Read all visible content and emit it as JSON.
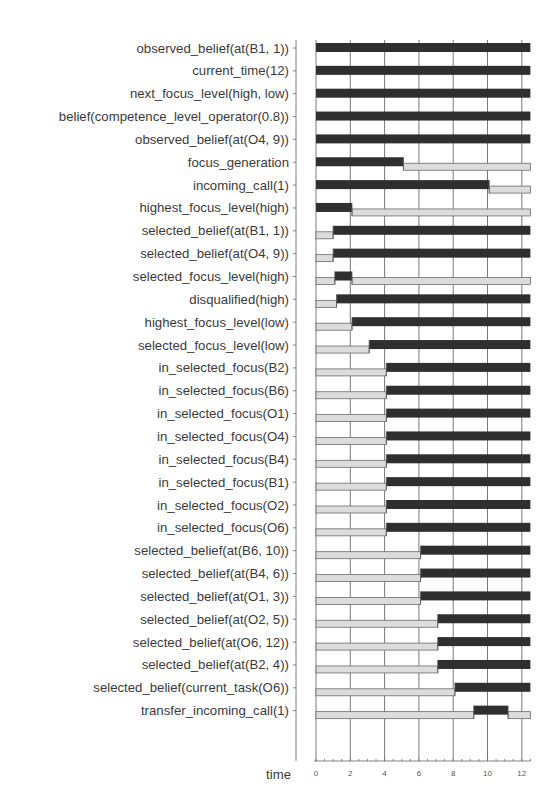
{
  "chart_data": {
    "type": "timeline",
    "title": "",
    "xlabel": "time",
    "ylabel": "",
    "xlim": [
      0,
      12.5
    ],
    "x_ticks": [
      0,
      2,
      4,
      6,
      8,
      10,
      12
    ],
    "grid": true,
    "legend": {
      "dark_bar": "state true",
      "light_bar": "state false"
    },
    "colors": {
      "true": "#2f2f2f",
      "false": "#dcdcdc",
      "grid": "#555555"
    },
    "rows": [
      {
        "label": "observed_belief(at(B1, 1))",
        "segments": [
          {
            "state": true,
            "start": 0,
            "end": 12.5
          }
        ]
      },
      {
        "label": "current_time(12)",
        "segments": [
          {
            "state": true,
            "start": 0,
            "end": 12.5
          }
        ]
      },
      {
        "label": "next_focus_level(high, low)",
        "segments": [
          {
            "state": true,
            "start": 0,
            "end": 12.5
          }
        ]
      },
      {
        "label": "belief(competence_level_operator(0.8))",
        "segments": [
          {
            "state": true,
            "start": 0,
            "end": 12.5
          }
        ]
      },
      {
        "label": "observed_belief(at(O4, 9))",
        "segments": [
          {
            "state": true,
            "start": 0,
            "end": 12.5
          }
        ]
      },
      {
        "label": "focus_generation",
        "segments": [
          {
            "state": true,
            "start": 0,
            "end": 5.1
          },
          {
            "state": false,
            "start": 5.1,
            "end": 12.5
          }
        ]
      },
      {
        "label": "incoming_call(1)",
        "segments": [
          {
            "state": true,
            "start": 0,
            "end": 10.1
          },
          {
            "state": false,
            "start": 10.1,
            "end": 12.5
          }
        ]
      },
      {
        "label": "highest_focus_level(high)",
        "segments": [
          {
            "state": true,
            "start": 0,
            "end": 2.1
          },
          {
            "state": false,
            "start": 2.1,
            "end": 12.5
          }
        ]
      },
      {
        "label": "selected_belief(at(B1, 1))",
        "segments": [
          {
            "state": false,
            "start": 0,
            "end": 1
          },
          {
            "state": true,
            "start": 1,
            "end": 12.5
          }
        ]
      },
      {
        "label": "selected_belief(at(O4, 9))",
        "segments": [
          {
            "state": false,
            "start": 0,
            "end": 1
          },
          {
            "state": true,
            "start": 1,
            "end": 12.5
          }
        ]
      },
      {
        "label": "selected_focus_level(high)",
        "segments": [
          {
            "state": false,
            "start": 0,
            "end": 1.1
          },
          {
            "state": true,
            "start": 1.1,
            "end": 2.1
          },
          {
            "state": false,
            "start": 2.1,
            "end": 12.5
          }
        ]
      },
      {
        "label": "disqualified(high)",
        "segments": [
          {
            "state": false,
            "start": 0,
            "end": 1.2
          },
          {
            "state": true,
            "start": 1.2,
            "end": 12.5
          }
        ]
      },
      {
        "label": "highest_focus_level(low)",
        "segments": [
          {
            "state": false,
            "start": 0,
            "end": 2.1
          },
          {
            "state": true,
            "start": 2.1,
            "end": 12.5
          }
        ]
      },
      {
        "label": "selected_focus_level(low)",
        "segments": [
          {
            "state": false,
            "start": 0,
            "end": 3.1
          },
          {
            "state": true,
            "start": 3.1,
            "end": 12.5
          }
        ]
      },
      {
        "label": "in_selected_focus(B2)",
        "segments": [
          {
            "state": false,
            "start": 0,
            "end": 4.1
          },
          {
            "state": true,
            "start": 4.1,
            "end": 12.5
          }
        ]
      },
      {
        "label": "in_selected_focus(B6)",
        "segments": [
          {
            "state": false,
            "start": 0,
            "end": 4.1
          },
          {
            "state": true,
            "start": 4.1,
            "end": 12.5
          }
        ]
      },
      {
        "label": "in_selected_focus(O1)",
        "segments": [
          {
            "state": false,
            "start": 0,
            "end": 4.1
          },
          {
            "state": true,
            "start": 4.1,
            "end": 12.5
          }
        ]
      },
      {
        "label": "in_selected_focus(O4)",
        "segments": [
          {
            "state": false,
            "start": 0,
            "end": 4.1
          },
          {
            "state": true,
            "start": 4.1,
            "end": 12.5
          }
        ]
      },
      {
        "label": "in_selected_focus(B4)",
        "segments": [
          {
            "state": false,
            "start": 0,
            "end": 4.1
          },
          {
            "state": true,
            "start": 4.1,
            "end": 12.5
          }
        ]
      },
      {
        "label": "in_selected_focus(B1)",
        "segments": [
          {
            "state": false,
            "start": 0,
            "end": 4.1
          },
          {
            "state": true,
            "start": 4.1,
            "end": 12.5
          }
        ]
      },
      {
        "label": "in_selected_focus(O2)",
        "segments": [
          {
            "state": false,
            "start": 0,
            "end": 4.1
          },
          {
            "state": true,
            "start": 4.1,
            "end": 12.5
          }
        ]
      },
      {
        "label": "in_selected_focus(O6)",
        "segments": [
          {
            "state": false,
            "start": 0,
            "end": 4.1
          },
          {
            "state": true,
            "start": 4.1,
            "end": 12.5
          }
        ]
      },
      {
        "label": "selected_belief(at(B6, 10))",
        "segments": [
          {
            "state": false,
            "start": 0,
            "end": 6.1
          },
          {
            "state": true,
            "start": 6.1,
            "end": 12.5
          }
        ]
      },
      {
        "label": "selected_belief(at(B4, 6))",
        "segments": [
          {
            "state": false,
            "start": 0,
            "end": 6.1
          },
          {
            "state": true,
            "start": 6.1,
            "end": 12.5
          }
        ]
      },
      {
        "label": "selected_belief(at(O1, 3))",
        "segments": [
          {
            "state": false,
            "start": 0,
            "end": 6.1
          },
          {
            "state": true,
            "start": 6.1,
            "end": 12.5
          }
        ]
      },
      {
        "label": "selected_belief(at(O2, 5))",
        "segments": [
          {
            "state": false,
            "start": 0,
            "end": 7.1
          },
          {
            "state": true,
            "start": 7.1,
            "end": 12.5
          }
        ]
      },
      {
        "label": "selected_belief(at(O6, 12))",
        "segments": [
          {
            "state": false,
            "start": 0,
            "end": 7.1
          },
          {
            "state": true,
            "start": 7.1,
            "end": 12.5
          }
        ]
      },
      {
        "label": "selected_belief(at(B2, 4))",
        "segments": [
          {
            "state": false,
            "start": 0,
            "end": 7.1
          },
          {
            "state": true,
            "start": 7.1,
            "end": 12.5
          }
        ]
      },
      {
        "label": "selected_belief(current_task(O6))",
        "segments": [
          {
            "state": false,
            "start": 0,
            "end": 8.1
          },
          {
            "state": true,
            "start": 8.1,
            "end": 12.5
          }
        ]
      },
      {
        "label": "transfer_incoming_call(1)",
        "segments": [
          {
            "state": false,
            "start": 0,
            "end": 9.2
          },
          {
            "state": true,
            "start": 9.2,
            "end": 11.2
          },
          {
            "state": false,
            "start": 11.2,
            "end": 12.5
          }
        ]
      }
    ]
  }
}
